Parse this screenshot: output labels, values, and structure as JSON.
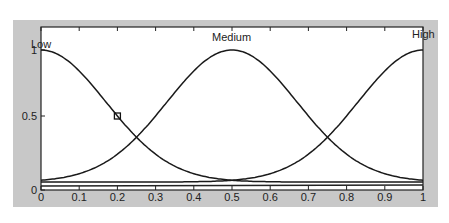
{
  "chart_data": {
    "type": "line",
    "title": "",
    "xlabel": "",
    "ylabel": "",
    "xlim": [
      0,
      1
    ],
    "ylim": [
      0,
      1
    ],
    "grid": false,
    "x_ticks": [
      "0",
      "0.1",
      "0.2",
      "0.3",
      "0.4",
      "0.5",
      "0.6",
      "0.7",
      "0.8",
      "0.9",
      "1"
    ],
    "y_ticks": [
      "0",
      "0.5",
      "1"
    ],
    "series": [
      {
        "name": "Low",
        "shape": "gaussian",
        "center": 0.0,
        "sigma": 0.17
      },
      {
        "name": "Medium",
        "shape": "gaussian",
        "center": 0.5,
        "sigma": 0.17
      },
      {
        "name": "High",
        "shape": "gaussian",
        "center": 1.0,
        "sigma": 0.17
      }
    ],
    "annotations": [
      {
        "type": "marker",
        "shape": "square",
        "x": 0.2,
        "y": 0.5
      }
    ],
    "labels": {
      "low": "Low",
      "medium": "Medium",
      "high": "High"
    }
  }
}
